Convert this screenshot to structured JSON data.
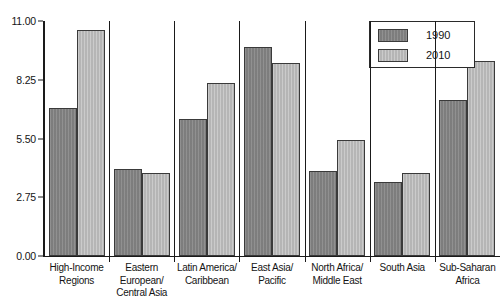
{
  "chart_data": {
    "type": "bar",
    "title": "",
    "subtitle": "",
    "xlabel": "",
    "ylabel": "",
    "ylim": [
      0,
      11
    ],
    "grid": false,
    "legend_position": "top-right",
    "y_ticks": [
      "0.00",
      "2.75",
      "5.50",
      "8.25",
      "11.00"
    ],
    "y_tick_values": [
      0,
      2.75,
      5.5,
      8.25,
      11
    ],
    "categories": [
      "High-Income\nRegions",
      "Eastern European/\nCentral Asia",
      "Latin America/\nCaribbean",
      "East Asia/\nPacific",
      "North Africa/\nMiddle East",
      "South Asia",
      "Sub-Saharan\nAfrica"
    ],
    "category_lines": [
      [
        "High-Income",
        "Regions"
      ],
      [
        "Eastern European/",
        "Central Asia"
      ],
      [
        "Latin America/",
        "Caribbean"
      ],
      [
        "East Asia/",
        "Pacific"
      ],
      [
        "North Africa/",
        "Middle East"
      ],
      [
        "South Asia"
      ],
      [
        "Sub-Saharan",
        "Africa"
      ]
    ],
    "series": [
      {
        "name": "1990",
        "color": "#848484",
        "values": [
          6.95,
          4.05,
          6.4,
          9.8,
          4.0,
          3.45,
          7.3
        ]
      },
      {
        "name": "2010",
        "color": "#bcbcbc",
        "values": [
          10.6,
          3.9,
          8.1,
          9.05,
          5.45,
          3.9,
          9.15
        ]
      }
    ]
  },
  "legend": {
    "items": [
      {
        "label": "1990",
        "series_class": "s1990"
      },
      {
        "label": "2010",
        "series_class": "s2010"
      }
    ]
  },
  "colors": {
    "series_1990": "#848484",
    "series_2010": "#bcbcbc",
    "axis": "#1a1a1a",
    "background": "#ffffff",
    "bar_outline": "#3a3a3a"
  }
}
